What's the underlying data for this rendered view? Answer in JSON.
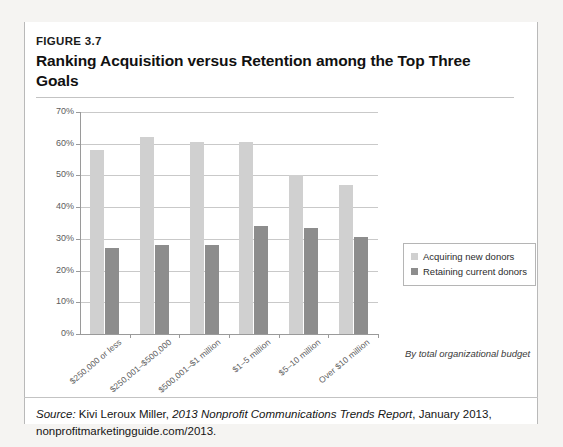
{
  "figure": {
    "number": "FIGURE 3.7",
    "title": "Ranking Acquisition versus Retention among the Top Three Goals"
  },
  "source": {
    "label": "Source:",
    "author": "Kivi Leroux Miller,",
    "work": "2013 Nonprofit Communications Trends Report",
    "rest": ", January 2013, nonprofitmarketingguide.com/2013."
  },
  "axis_note": "By total organizational budget",
  "colors": {
    "acquiring": "#d0d0d0",
    "retaining": "#8d8d8d",
    "gridline": "#c9c9c9",
    "axis": "#9a9a9a"
  },
  "chart_data": {
    "type": "bar",
    "title": "Ranking Acquisition versus Retention among the Top Three Goals",
    "xlabel": "By total organizational budget",
    "ylabel": "",
    "ylim": [
      0,
      70
    ],
    "ytick_labels": [
      "0%",
      "10%",
      "20%",
      "30%",
      "40%",
      "50%",
      "60%",
      "70%"
    ],
    "yticks": [
      0,
      10,
      20,
      30,
      40,
      50,
      60,
      70
    ],
    "grid": true,
    "legend_position": "right",
    "categories": [
      "$250,000 or less",
      "$250,001–$500,000",
      "$500,001–$1 million",
      "$1–5 million",
      "$5–10 million",
      "Over $10 million"
    ],
    "series": [
      {
        "name": "Acquiring new donors",
        "color": "#d0d0d0",
        "values": [
          58,
          62,
          60.5,
          60.5,
          50,
          47
        ]
      },
      {
        "name": "Retaining current donors",
        "color": "#8d8d8d",
        "values": [
          27,
          28,
          28,
          34,
          33.5,
          30.5
        ]
      }
    ]
  }
}
